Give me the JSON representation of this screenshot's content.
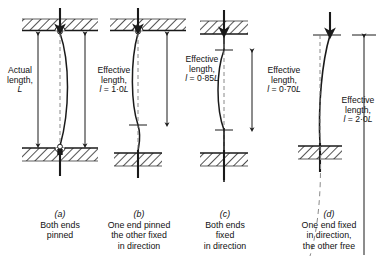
{
  "figure": {
    "type": "engineering-diagram",
    "background": "#ffffff",
    "ink": "#1a1a1a"
  },
  "actual_length_label": {
    "line1": "Actual",
    "line2": "length,",
    "line3": "L"
  },
  "columns": [
    {
      "key": "a",
      "caption_key": "(a)",
      "caption_lines": [
        "Both ends",
        "pinned"
      ],
      "effective_label": {
        "line1": "Effective",
        "line2": "length,",
        "symbol": "l",
        "equals": "=",
        "value": "1·0",
        "unit": "L"
      },
      "top_condition": "pinned",
      "bottom_condition": "pinned",
      "effective_factor": 1.0,
      "load_arrow": true
    },
    {
      "key": "b",
      "caption_key": "(b)",
      "caption_lines": [
        "One end pinned",
        "the other fixed",
        "in direction"
      ],
      "effective_label": {
        "line1": "Effective",
        "line2": "length,",
        "symbol": "l",
        "equals": "=",
        "value": "0·85",
        "unit": "L"
      },
      "top_condition": "pinned",
      "bottom_condition": "fixed",
      "effective_factor": 0.85,
      "load_arrow": true
    },
    {
      "key": "c",
      "caption_key": "(c)",
      "caption_lines": [
        "Both ends",
        "fixed",
        "in direction"
      ],
      "effective_label": {
        "line1": "Effective",
        "line2": "length,",
        "symbol": "l",
        "equals": "=",
        "value": "0·70",
        "unit": "L"
      },
      "top_condition": "fixed",
      "bottom_condition": "fixed",
      "effective_factor": 0.7,
      "load_arrow": true
    },
    {
      "key": "d",
      "caption_key": "(d)",
      "caption_lines": [
        "One end fixed",
        "in direction,",
        "the other free"
      ],
      "effective_label": {
        "line1": "Effective",
        "line2": "length,",
        "symbol": "l",
        "equals": "=",
        "value": "2·0",
        "unit": "L"
      },
      "top_condition": "free",
      "bottom_condition": "fixed",
      "effective_factor": 2.0,
      "load_arrow": true
    }
  ]
}
